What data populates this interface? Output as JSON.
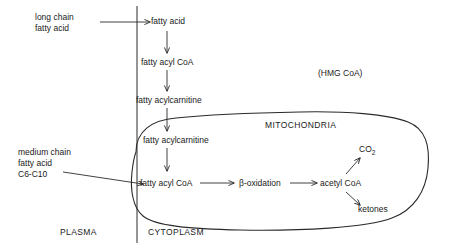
{
  "diagram": {
    "compartments": [
      {
        "id": "plasma",
        "label": "PLASMA"
      },
      {
        "id": "cytoplasm",
        "label": "CYTOPLASM"
      },
      {
        "id": "mitochondria",
        "label": "MITOCHONDRIA"
      }
    ],
    "nodes": [
      {
        "id": "long-chain-fatty-acid",
        "label": "long chain\nfatty acid"
      },
      {
        "id": "fatty-acid",
        "label": "fatty acid"
      },
      {
        "id": "fatty-acyl-coa-cyto",
        "label": "fatty acyl CoA"
      },
      {
        "id": "fatty-acylcarnitine-cyto",
        "label": "fatty acylcarnitine"
      },
      {
        "id": "hmg-coa",
        "label": "(HMG CoA)"
      },
      {
        "id": "fatty-acylcarnitine-mito",
        "label": "fatty acylcarnitine"
      },
      {
        "id": "medium-chain-fatty-acid",
        "label": "medium chain\nfatty acid\nC6-C10"
      },
      {
        "id": "fatty-acyl-coa-mito",
        "label": "fatty acyl CoA"
      },
      {
        "id": "beta-oxidation",
        "label": "β-oxidation"
      },
      {
        "id": "acetyl-coa",
        "label": "acetyl CoA"
      },
      {
        "id": "co2",
        "label": "CO",
        "sub": "2"
      },
      {
        "id": "ketones",
        "label": "ketones"
      }
    ]
  }
}
